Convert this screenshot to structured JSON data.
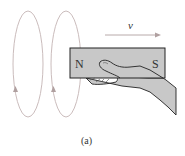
{
  "figure": {
    "caption": "(a)",
    "velocity_label": "v",
    "magnet": {
      "north_label": "N",
      "south_label": "S",
      "fill": "#c8c8c8",
      "stroke": "#222222"
    },
    "loops": {
      "count": 2,
      "stroke": "#b8a8a8",
      "arrow_direction": "up"
    },
    "hand": {
      "fill": "#c8c8c8",
      "stroke": "#222222"
    }
  }
}
